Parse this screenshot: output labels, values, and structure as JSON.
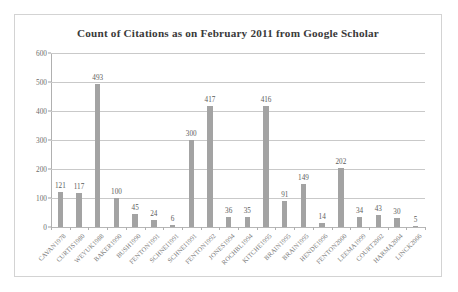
{
  "chart_data": {
    "type": "bar",
    "title": "Count of Citations as on February 2011 from Google Scholar",
    "xlabel": "",
    "ylabel": "",
    "ylim": [
      0,
      600
    ],
    "ytick_values": [
      0,
      100,
      200,
      300,
      400,
      500,
      600
    ],
    "ytick_labels": [
      "0",
      "100",
      "200",
      "300",
      "400",
      "500",
      "600"
    ],
    "grid": true,
    "legend": false,
    "bar_color": "#a3a3a3",
    "show_value_labels": true,
    "categories": [
      "CAVAN1978",
      "CURTIS1980",
      "WEYUK1988",
      "BAKER1990",
      "BUSH1990",
      "FENTON1991",
      "SCHNEI1991",
      "SCHNEI1991",
      "FENTON1992",
      "JONES1994",
      "ROCHBL1994",
      "KITCHE1995",
      "BRAIN1995",
      "BRAIN1995",
      "HENDE1996",
      "FENTON2000",
      "LEEMA1999",
      "COURT2002",
      "HARMA2004",
      "LINCK2006"
    ],
    "values": [
      121,
      117,
      493,
      100,
      45,
      24,
      6,
      300,
      417,
      36,
      35,
      416,
      91,
      149,
      14,
      202,
      34,
      43,
      30,
      5
    ],
    "value_labels": [
      "121",
      "117",
      "493",
      "100",
      "45",
      "24",
      "6",
      "300",
      "417",
      "36",
      "35",
      "416",
      "91",
      "149",
      "14",
      "202",
      "34",
      "43",
      "30",
      "5"
    ]
  }
}
